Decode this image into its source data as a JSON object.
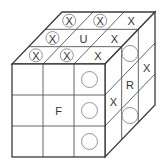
{
  "colors": {
    "line": "#3a3a3a",
    "text": "#333333",
    "circle": "#888888",
    "background": "#ffffff"
  },
  "cube": {
    "front": {
      "x": 12,
      "y": 64,
      "size": 93
    },
    "depth_offset": {
      "dx": 50,
      "dy": -52
    },
    "grid": 3
  },
  "faces": {
    "top": {
      "label": "U",
      "rows_back_to_front": [
        [
          "circled-x",
          "circled-x",
          "x"
        ],
        [
          "circled-x",
          "U",
          "x"
        ],
        [
          "circled-x",
          "circled-x",
          "x"
        ]
      ]
    },
    "front": {
      "label": "F",
      "rows_top_to_bottom": [
        [
          "",
          "",
          "circle"
        ],
        [
          "",
          "F",
          "circle"
        ],
        [
          "",
          "",
          "circle"
        ]
      ]
    },
    "right": {
      "label": "R",
      "rows_top_to_bottom_cols_front_to_back": [
        [
          "",
          "circle",
          ""
        ],
        [
          "x",
          "R",
          "x"
        ],
        [
          "",
          "circle",
          ""
        ]
      ]
    }
  },
  "symbols": {
    "x": "X",
    "circled-x": "X",
    "U": "U",
    "F": "F",
    "R": "R"
  }
}
